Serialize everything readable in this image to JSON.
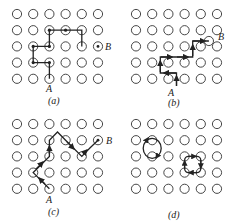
{
  "figure": {
    "panels": [
      {
        "id": "a",
        "caption": "(a)",
        "start_label": "A",
        "end_label": "B",
        "description": "lattice path with right-angle steps from A to B"
      },
      {
        "id": "b",
        "caption": "(b)",
        "start_label": "A",
        "end_label": "B",
        "description": "path with arrows between lattice sites from A to B"
      },
      {
        "id": "c",
        "caption": "(c)",
        "start_label": "A",
        "end_label": "B",
        "description": "diagonal zig-zag path through sites from A to B"
      },
      {
        "id": "d",
        "caption": "(d)",
        "start_label": "",
        "end_label": "",
        "description": "two closed loops: a two-site ring and a four-site square"
      }
    ],
    "grid": {
      "columns": 6,
      "rows": 5
    },
    "colors": {
      "stroke": "#222222",
      "background": "#ffffff"
    }
  }
}
